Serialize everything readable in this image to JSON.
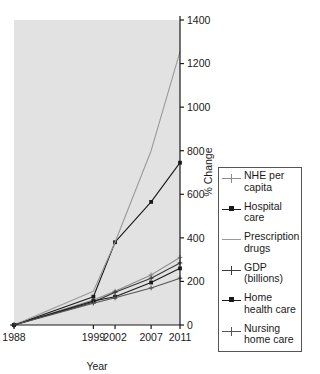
{
  "chart_data": {
    "type": "line",
    "title": "",
    "xlabel": "Year",
    "ylabel": "% Change",
    "categories": [
      "1988",
      "1999",
      "2002",
      "2007",
      "2011"
    ],
    "x": [
      1988,
      1999,
      2002,
      2007,
      2011
    ],
    "ylim": [
      0,
      1400
    ],
    "yticks": [
      0,
      200,
      400,
      600,
      800,
      1000,
      1200,
      1400
    ],
    "ytick_labels": [
      "0",
      "200",
      "400",
      "600",
      "800",
      "1000",
      "1200",
      "1400"
    ],
    "y_axis_position": "right",
    "grid": false,
    "legend_position": "right",
    "plot_background": "#e2e2e2",
    "series": [
      {
        "name": "NHE per capita",
        "label_line1": "NHE per",
        "label_line2": "capita",
        "color": "#8c8c8c",
        "marker": "plus",
        "values": [
          0,
          115,
          155,
          230,
          310
        ]
      },
      {
        "name": "Hospital care",
        "label_line1": "Hospital",
        "label_line2": "care",
        "color": "#1a1a1a",
        "marker": "square",
        "values": [
          0,
          130,
          380,
          565,
          745
        ]
      },
      {
        "name": "Prescription drugs",
        "label_line1": "Prescription",
        "label_line2": "drugs",
        "color": "#9a9a9a",
        "marker": "none",
        "values": [
          0,
          155,
          380,
          800,
          1255
        ]
      },
      {
        "name": "GDP (billions)",
        "label_line1": "GDP",
        "label_line2": "(billions)",
        "color": "#3a3a3a",
        "marker": "plus",
        "values": [
          0,
          105,
          150,
          215,
          285
        ]
      },
      {
        "name": "Home health care",
        "label_line1": "Home",
        "label_line2": "health care",
        "color": "#1a1a1a",
        "marker": "square",
        "values": [
          0,
          110,
          130,
          195,
          260
        ]
      },
      {
        "name": "Nursing home care",
        "label_line1": "Nursing",
        "label_line2": "home care",
        "color": "#555555",
        "marker": "plus",
        "values": [
          0,
          100,
          125,
          170,
          215
        ]
      }
    ]
  }
}
